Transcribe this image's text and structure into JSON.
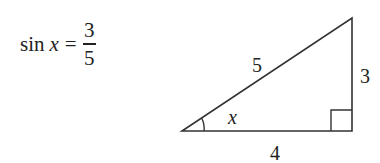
{
  "formula": {
    "function": "sin",
    "variable": "x",
    "equals": "=",
    "numerator": "3",
    "denominator": "5"
  },
  "triangle": {
    "hypotenuse_label": "5",
    "opposite_label": "3",
    "adjacent_label": "4",
    "angle_label": "x",
    "right_angle_marker": true,
    "stroke_color": "#333333"
  }
}
